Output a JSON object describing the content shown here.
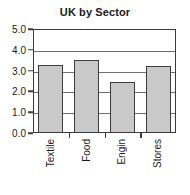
{
  "chart_data": {
    "type": "bar",
    "title": "UK by Sector",
    "xlabel": "",
    "ylabel": "",
    "categories": [
      "Textile",
      "Food",
      "Engin",
      "Stores"
    ],
    "values": [
      3.25,
      3.5,
      2.45,
      3.2
    ],
    "ylim": [
      0.0,
      5.0
    ],
    "ytick_labels": [
      "5.0",
      "4.0",
      "3.0",
      "2.0",
      "1.0",
      "0.0"
    ],
    "ytick_values": [
      5.0,
      4.0,
      3.0,
      2.0,
      1.0,
      0.0
    ],
    "grid": true,
    "legend": "none",
    "bar_fill_color": "#c9c9c9",
    "bar_border_color": "#3d3d3d",
    "axis_color": "#3a3a3a",
    "gridline_color": "#6e6e6e",
    "background_color": "#ffffff"
  }
}
